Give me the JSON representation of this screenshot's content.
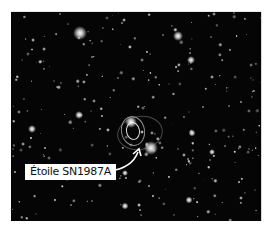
{
  "image": {
    "subject": "Star field with supernova remnant ring",
    "background_color": "#050505",
    "frame_color": "#ffffff"
  },
  "annotation": {
    "label": "Étoile SN1987A",
    "arrow_color": "#ffffff",
    "target": "supernova-ring"
  },
  "bright_stars": [
    {
      "x": 80,
      "y": 32,
      "size": 14
    },
    {
      "x": 178,
      "y": 35,
      "size": 10
    },
    {
      "x": 191,
      "y": 59,
      "size": 8
    },
    {
      "x": 131,
      "y": 121,
      "size": 12
    },
    {
      "x": 151,
      "y": 147,
      "size": 14
    },
    {
      "x": 79,
      "y": 114,
      "size": 8
    },
    {
      "x": 32,
      "y": 128,
      "size": 8
    },
    {
      "x": 192,
      "y": 132,
      "size": 7
    },
    {
      "x": 212,
      "y": 151,
      "size": 6
    },
    {
      "x": 125,
      "y": 172,
      "size": 6
    },
    {
      "x": 189,
      "y": 199,
      "size": 7
    },
    {
      "x": 125,
      "y": 205,
      "size": 7
    }
  ],
  "rings": [
    {
      "x": 133,
      "y": 130,
      "w": 12,
      "h": 16,
      "border": "1.5px solid rgba(255,255,255,0.85)"
    },
    {
      "x": 133,
      "y": 130,
      "w": 22,
      "h": 28,
      "border": "1px solid rgba(230,230,230,0.6)"
    },
    {
      "x": 140,
      "y": 132,
      "w": 44,
      "h": 32,
      "border": "1px solid rgba(200,200,200,0.35)"
    }
  ]
}
